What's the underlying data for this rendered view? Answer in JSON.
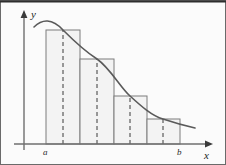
{
  "figure": {
    "frame": {
      "width": 226,
      "height": 165,
      "background_color": "#fbfbfb",
      "border_color": "#4a4a4a"
    },
    "axes": {
      "y_axis_label": "y",
      "x_axis_label": "x",
      "y_axis_x": 24,
      "x_axis_y": 144,
      "axis_color": "#6f6f6f",
      "y_axis_top": 14,
      "x_axis_right": 212
    },
    "ticks": [
      {
        "label": "a",
        "x": 46
      },
      {
        "label": "b",
        "x": 180
      }
    ]
  },
  "chart_data": {
    "type": "bar",
    "xlabel": "x",
    "ylabel": "y",
    "grid": false,
    "legend": null,
    "xlim": [
      24,
      212
    ],
    "ylim": [
      144,
      14
    ],
    "interval": {
      "a_label": "a",
      "b_label": "b",
      "a_x": 46,
      "b_x": 180
    },
    "n_rectangles": 4,
    "bar_fill_color": "#f3f3f3",
    "bar_edge_color": "#7d7d7d",
    "midline_color": "#3a3a3a",
    "curve_color": "#5a5a5a",
    "categories": [
      "x1",
      "x2",
      "x3",
      "x4"
    ],
    "values": [
      114,
      85,
      48,
      25
    ],
    "bars": [
      {
        "x0": 46,
        "x1": 80,
        "top": 30,
        "midpoint": 63,
        "height": 114
      },
      {
        "x0": 80,
        "x1": 114,
        "top": 59,
        "midpoint": 97,
        "height": 85
      },
      {
        "x0": 114,
        "x1": 147,
        "top": 96,
        "midpoint": 130,
        "height": 48
      },
      {
        "x0": 147,
        "x1": 180,
        "top": 119,
        "midpoint": 163,
        "height": 25
      }
    ],
    "curve": {
      "description": "smooth curve rising slightly to a peak then decreasing, crossing each rectangle top at its midpoint",
      "path": "M 34,27 C 42,19 52,18 63,30 C 74,41 86,52 97,59 C 110,68 120,87 130,96 C 141,106 152,116 163,119 C 175,123 186,126 195,128"
    }
  }
}
